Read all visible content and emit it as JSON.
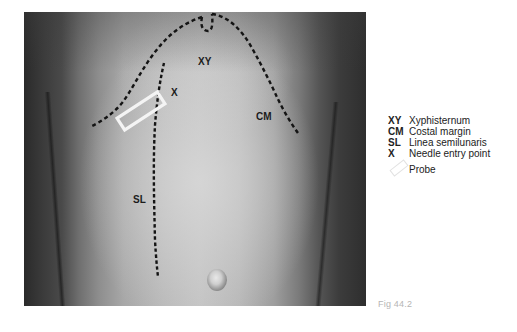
{
  "figure": {
    "caption": "Fig 44.2",
    "photo_description": "Anterior abdominal wall with surface markings",
    "labels": {
      "xy": "XY",
      "x": "X",
      "cm": "CM",
      "sl": "SL"
    },
    "colors": {
      "dotted_line": "#141414",
      "probe_outline": "#f4f4f4",
      "label_text": "#1c1c1c",
      "caption_text": "#b5b5b5"
    }
  },
  "legend": {
    "items": [
      {
        "abbr": "XY",
        "text": "Xyphisternum"
      },
      {
        "abbr": "CM",
        "text": "Costal margin"
      },
      {
        "abbr": "SL",
        "text": "Linea semilunaris"
      },
      {
        "abbr": "X",
        "text": "Needle entry point"
      },
      {
        "abbr": "",
        "icon": "probe-rectangle-icon",
        "text": "Probe"
      }
    ]
  }
}
